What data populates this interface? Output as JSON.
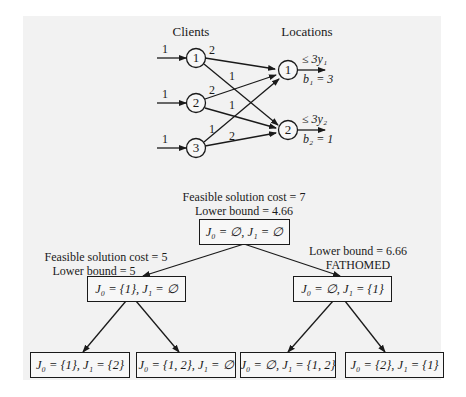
{
  "network": {
    "clients_heading": "Clients",
    "locations_heading": "Locations",
    "clients": [
      {
        "id": "1",
        "demand": "1"
      },
      {
        "id": "2",
        "demand": "1"
      },
      {
        "id": "3",
        "demand": "1"
      }
    ],
    "locations": [
      {
        "id": "1",
        "capacity": "≤ 3y₁",
        "b": "b₁ = 3"
      },
      {
        "id": "2",
        "capacity": "≤ 3y₂",
        "b": "b₂ = 1"
      }
    ],
    "edges": [
      {
        "from": "1",
        "to": "1",
        "cost": "2"
      },
      {
        "from": "1",
        "to": "2",
        "cost": "1"
      },
      {
        "from": "2",
        "to": "1",
        "cost": "2"
      },
      {
        "from": "2",
        "to": "2",
        "cost": "1"
      },
      {
        "from": "3",
        "to": "1",
        "cost": "1"
      },
      {
        "from": "3",
        "to": "2",
        "cost": "2"
      }
    ]
  },
  "tree": {
    "root": {
      "annotation_line1": "Feasible solution cost = 7",
      "annotation_line2": "Lower bound = 4.66",
      "label": "J₀ = ∅,  J₁ = ∅"
    },
    "left": {
      "annotation_line1": "Feasible solution cost = 5",
      "annotation_line2": "Lower bound = 5",
      "label": "J₀ = {1},  J₁ = ∅"
    },
    "right": {
      "annotation_line1": "Lower bound = 6.66",
      "annotation_line2": "FATHOMED",
      "label": "J₀ = ∅,  J₁ = {1}"
    },
    "leaves": [
      {
        "label": "J₀ = {1}, J₁ = {2}"
      },
      {
        "label": "J₀ = {1, 2}, J₁ = ∅"
      },
      {
        "label": "J₀ = ∅, J₁ = {1, 2}"
      },
      {
        "label": "J₀ = {2}, J₁ = {1}"
      }
    ]
  }
}
